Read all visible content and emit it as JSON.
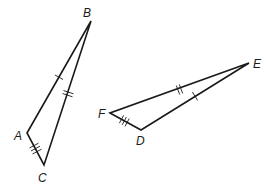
{
  "diagram": {
    "triangles": [
      {
        "name": "ABC",
        "vertices": [
          {
            "label": "A",
            "x": 27,
            "y": 133,
            "label_x": 14,
            "label_y": 140
          },
          {
            "label": "B",
            "x": 91,
            "y": 21,
            "label_x": 83,
            "label_y": 17
          },
          {
            "label": "C",
            "x": 44,
            "y": 165,
            "label_x": 38,
            "label_y": 182
          }
        ],
        "sides": [
          {
            "from": "A",
            "to": "B",
            "ticks": 1
          },
          {
            "from": "B",
            "to": "C",
            "ticks": 2
          },
          {
            "from": "A",
            "to": "C",
            "ticks": 3
          }
        ]
      },
      {
        "name": "FDE",
        "vertices": [
          {
            "label": "F",
            "x": 110,
            "y": 113,
            "label_x": 98,
            "label_y": 118
          },
          {
            "label": "D",
            "x": 141,
            "y": 130,
            "label_x": 136,
            "label_y": 145
          },
          {
            "label": "E",
            "x": 249,
            "y": 63,
            "label_x": 253,
            "label_y": 68
          }
        ],
        "sides": [
          {
            "from": "F",
            "to": "E",
            "ticks": 2
          },
          {
            "from": "D",
            "to": "E",
            "ticks": 1
          },
          {
            "from": "F",
            "to": "D",
            "ticks": 3
          }
        ]
      }
    ],
    "colors": {
      "stroke": "#1a1a1a",
      "background": "#ffffff"
    }
  }
}
